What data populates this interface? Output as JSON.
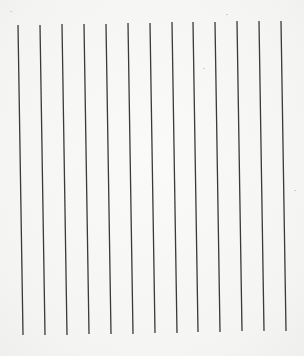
{
  "page": {
    "background": "#f7f7f5",
    "line_color": "#3a3a3a",
    "line_width": 1.3
  },
  "lines": {
    "count": 13,
    "top": [
      {
        "x": 18,
        "y": 25
      },
      {
        "x": 40,
        "y": 25
      },
      {
        "x": 62,
        "y": 24
      },
      {
        "x": 84,
        "y": 24
      },
      {
        "x": 106,
        "y": 24
      },
      {
        "x": 128,
        "y": 23
      },
      {
        "x": 150,
        "y": 23
      },
      {
        "x": 172,
        "y": 22
      },
      {
        "x": 193,
        "y": 22
      },
      {
        "x": 215,
        "y": 22
      },
      {
        "x": 237,
        "y": 21
      },
      {
        "x": 259,
        "y": 21
      },
      {
        "x": 281,
        "y": 21
      }
    ],
    "bottom": [
      {
        "x": 23,
        "y": 335
      },
      {
        "x": 45,
        "y": 335
      },
      {
        "x": 67,
        "y": 335
      },
      {
        "x": 89,
        "y": 334
      },
      {
        "x": 111,
        "y": 334
      },
      {
        "x": 133,
        "y": 334
      },
      {
        "x": 155,
        "y": 333
      },
      {
        "x": 177,
        "y": 333
      },
      {
        "x": 198,
        "y": 332
      },
      {
        "x": 220,
        "y": 332
      },
      {
        "x": 242,
        "y": 331
      },
      {
        "x": 264,
        "y": 331
      },
      {
        "x": 286,
        "y": 331
      }
    ]
  },
  "specks": [
    {
      "x": 10,
      "y": 11
    },
    {
      "x": 203,
      "y": 68
    },
    {
      "x": 226,
      "y": 14
    },
    {
      "x": 294,
      "y": 190
    }
  ]
}
